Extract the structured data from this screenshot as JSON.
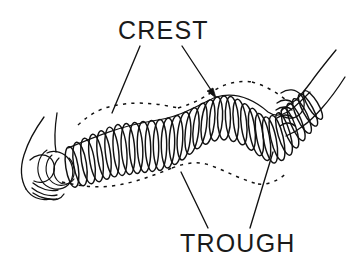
{
  "figure": {
    "background_color": "#ffffff",
    "ink_color": "#111111",
    "width": 347,
    "height": 269
  },
  "labels": {
    "crest": {
      "text": "CREST",
      "x": 118,
      "y": 39
    },
    "trough": {
      "text": "TROUGH",
      "x": 180,
      "y": 252
    }
  },
  "leaders": {
    "crest_left": {
      "name": "crest-leader-left",
      "from_x": 140,
      "from_y": 46,
      "to_x": 112,
      "to_y": 113,
      "arrowhead": false
    },
    "crest_right": {
      "name": "crest-leader-right",
      "from_x": 182,
      "from_y": 46,
      "to_x": 215,
      "to_y": 96,
      "arrowhead": true
    },
    "trough_left": {
      "name": "trough-leader-left",
      "from_x": 208,
      "from_y": 228,
      "to_x": 181,
      "to_y": 172,
      "arrowhead": false
    },
    "trough_right": {
      "name": "trough-leader-right",
      "from_x": 250,
      "from_y": 228,
      "to_x": 273,
      "to_y": 152,
      "arrowhead": false
    }
  },
  "icons": {
    "left_hand": "left-hand-icon",
    "right_hand": "right-hand-icon",
    "coil_spring": "coil-spring-icon",
    "dashed_envelope": "dashed-envelope-icon"
  },
  "wave": {
    "description": "Stretched slinky held at both ends forming one transverse wave with a crest and troughs",
    "coil_count": 33,
    "crest_peak_x": 215,
    "trough_points_x": [
      120,
      272
    ]
  }
}
